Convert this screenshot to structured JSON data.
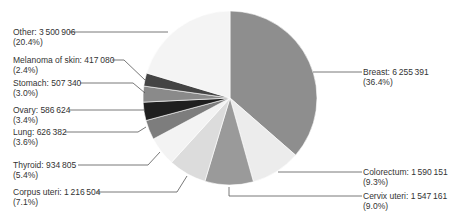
{
  "chart_data": {
    "type": "pie",
    "title": "",
    "start_angle": "12 o'clock, clockwise",
    "slices": [
      {
        "label": "Breast",
        "value": 6255391,
        "value_text": "6 255 391",
        "percent": 36.4,
        "percent_text": "(36.4%)",
        "color": "#8e8e8e"
      },
      {
        "label": "Colorectum",
        "value": 1590151,
        "value_text": "1 590 151",
        "percent": 9.3,
        "percent_text": "(9.3%)",
        "color": "#ececec"
      },
      {
        "label": "Cervix uteri",
        "value": 1547161,
        "value_text": "1 547 161",
        "percent": 9.0,
        "percent_text": "(9.0%)",
        "color": "#9a9a9a"
      },
      {
        "label": "Corpus uteri",
        "value": 1216504,
        "value_text": "1 216 504",
        "percent": 7.1,
        "percent_text": "(7.1%)",
        "color": "#dcdcdc"
      },
      {
        "label": "Thyroid",
        "value": 934805,
        "value_text": "934 805",
        "percent": 5.4,
        "percent_text": "(5.4%)",
        "color": "#f3f3f3"
      },
      {
        "label": "Lung",
        "value": 626382,
        "value_text": "626 382",
        "percent": 3.6,
        "percent_text": "(3.6%)",
        "color": "#7d7d7d"
      },
      {
        "label": "Ovary",
        "value": 586624,
        "value_text": "586 624",
        "percent": 3.4,
        "percent_text": "(3.4%)",
        "color": "#1f1f1f"
      },
      {
        "label": "Stomach",
        "value": 507340,
        "value_text": "507 340",
        "percent": 3.0,
        "percent_text": "(3.0%)",
        "color": "#8a8a8a"
      },
      {
        "label": "Melanoma of skin",
        "value": 417080,
        "value_text": "417 080",
        "percent": 2.4,
        "percent_text": "(2.4%)",
        "color": "#444444"
      },
      {
        "label": "Other",
        "value": 3500906,
        "value_text": "3 500 906",
        "percent": 20.4,
        "percent_text": "(20.4%)",
        "color": "#f4f4f4"
      }
    ],
    "legend": "none (leader-line labels)"
  },
  "labels": {
    "breast": {
      "line1": "Breast: 6 255 391",
      "line2": "(36.4%)"
    },
    "colorectum": {
      "line1": "Colorectum: 1 590 151",
      "line2": "(9.3%)"
    },
    "cervix": {
      "line1": "Cervix uteri: 1 547 161",
      "line2": "(9.0%)"
    },
    "corpus": {
      "line1": "Corpus uteri: 1 216 504",
      "line2": "(7.1%)"
    },
    "thyroid": {
      "line1": "Thyroid: 934 805",
      "line2": "(5.4%)"
    },
    "lung": {
      "line1": "Lung: 626 382",
      "line2": "(3.6%)"
    },
    "ovary": {
      "line1": "Ovary: 586 624",
      "line2": "(3.4%)"
    },
    "stomach": {
      "line1": "Stomach: 507 340",
      "line2": "(3.0%)"
    },
    "melanoma": {
      "line1": "Melanoma of skin: 417 080",
      "line2": "(2.4%)"
    },
    "other": {
      "line1": "Other: 3 500 906",
      "line2": "(20.4%)"
    }
  }
}
